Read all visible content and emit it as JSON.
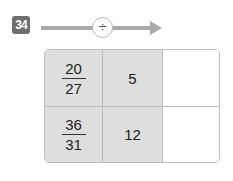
{
  "problem": {
    "number": "34",
    "operator_symbol": "÷",
    "operator_name": "divide"
  },
  "table": {
    "rows": [
      {
        "fraction": {
          "numerator": "20",
          "denominator": "27"
        },
        "divisor": "5",
        "answer": ""
      },
      {
        "fraction": {
          "numerator": "36",
          "denominator": "31"
        },
        "divisor": "12",
        "answer": ""
      }
    ]
  },
  "colors": {
    "badge": "#6e6e6e",
    "arrow": "#a9a9a9",
    "shaded_cell": "#dedede",
    "border": "#bdbdbd"
  }
}
